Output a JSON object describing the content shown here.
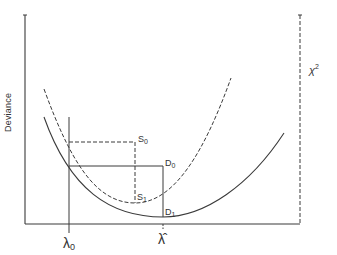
{
  "diagram": {
    "y_axis_label": "Deviance",
    "right_axis_label": "χ",
    "right_axis_superscript": "2",
    "x_ticks": [
      {
        "symbol": "λ",
        "subscript": "0"
      },
      {
        "symbol": "λ̂",
        "subscript": ""
      }
    ],
    "points": {
      "S0": {
        "letter": "S",
        "subscript": "0"
      },
      "S1": {
        "letter": "S",
        "subscript": "1"
      },
      "D0": {
        "letter": "D",
        "subscript": "0"
      },
      "D1": {
        "letter": "D",
        "subscript": "1"
      }
    },
    "curves": [
      {
        "name": "chi-square-curve",
        "style": "dashed",
        "min_label": "S1"
      },
      {
        "name": "deviance-curve",
        "style": "solid",
        "min_label": "D1"
      }
    ],
    "colors": {
      "line": "#3a3a3a",
      "background": "#ffffff"
    }
  }
}
